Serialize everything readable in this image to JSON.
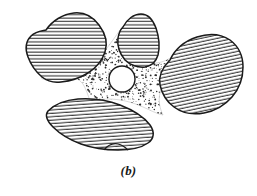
{
  "figure": {
    "caption": "(b)",
    "background_color": "#ffffff",
    "line_color": "#1a1a1a",
    "hatch_color": "#3a3a3a",
    "stipple_color": "#2b2b2b",
    "pore_fill": "#ffffff",
    "grain_fill": "#ffffff",
    "elements": {
      "grain_upper_left": {
        "name": "grain-upper-left",
        "hatch_style": "horizontal",
        "hatch_angle_deg": 0,
        "hatch_spacing_px": 3.4
      },
      "grain_top_middle": {
        "name": "grain-top-middle",
        "hatch_style": "horizontal",
        "hatch_angle_deg": 0,
        "hatch_spacing_px": 3.4
      },
      "grain_right": {
        "name": "grain-right",
        "hatch_style": "diagonal",
        "hatch_angle_deg": -12,
        "hatch_spacing_px": 3.4
      },
      "grain_bottom": {
        "name": "grain-bottom",
        "hatch_style": "near-horizontal",
        "hatch_angle_deg": -4,
        "hatch_spacing_px": 3.4
      },
      "cement_matrix": {
        "name": "cement-matrix",
        "fill_style": "stipple",
        "dot_count": 2100
      },
      "pore": {
        "name": "central-pore",
        "shape": "circle",
        "center_x": 122,
        "center_y": 79,
        "radius": 13
      }
    }
  }
}
